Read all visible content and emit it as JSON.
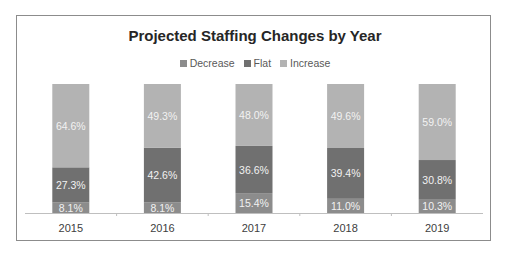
{
  "chart_data": {
    "type": "bar",
    "stacked": true,
    "percent_stacked": true,
    "title": "Projected Staffing Changes by Year",
    "xlabel": "",
    "ylabel": "",
    "ylim": [
      0,
      100
    ],
    "grid": false,
    "legend_position": "top",
    "categories": [
      "2015",
      "2016",
      "2017",
      "2018",
      "2019"
    ],
    "series": [
      {
        "name": "Decrease",
        "color": "#8c8c8c",
        "values": [
          8.1,
          8.1,
          15.4,
          11.0,
          10.3
        ],
        "labels": [
          "8.1%",
          "8.1%",
          "15.4%",
          "11.0%",
          "10.3%"
        ]
      },
      {
        "name": "Flat",
        "color": "#707070",
        "values": [
          27.3,
          42.6,
          36.6,
          39.4,
          30.8
        ],
        "labels": [
          "27.3%",
          "42.6%",
          "36.6%",
          "39.4%",
          "30.8%"
        ]
      },
      {
        "name": "Increase",
        "color": "#b3b3b3",
        "values": [
          64.6,
          49.3,
          48.0,
          49.6,
          59.0
        ],
        "labels": [
          "64.6%",
          "49.3%",
          "48.0%",
          "49.6%",
          "59.0%"
        ]
      }
    ]
  }
}
